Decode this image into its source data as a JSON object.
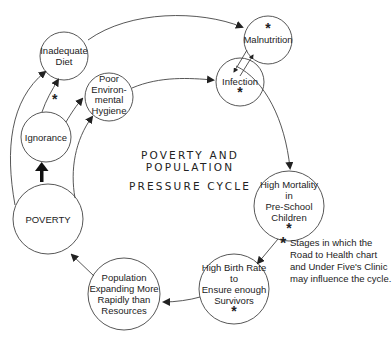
{
  "title": {
    "line1": "POVERTY AND POPULATION",
    "line2": "PRESSURE CYCLE"
  },
  "nodes": {
    "inadequate_diet": {
      "lines": [
        "Inadequate",
        "Diet"
      ],
      "star": false
    },
    "poor_hygiene": {
      "lines": [
        "Poor",
        "Environ-",
        "mental",
        "Hygiene"
      ],
      "star": false
    },
    "malnutrition": {
      "lines": [
        "Malnutrition"
      ],
      "star": true
    },
    "infection": {
      "lines": [
        "Infection"
      ],
      "star": true
    },
    "ignorance": {
      "lines": [
        "Ignorance"
      ],
      "star": false
    },
    "poverty": {
      "lines": [
        "POVERTY"
      ],
      "star": false
    },
    "high_mortality": {
      "lines": [
        "High Mortality",
        "in",
        "Pre-School",
        "Children"
      ],
      "star": true
    },
    "high_birth_rate": {
      "lines": [
        "High Birth Rate",
        "to",
        "Ensure enough",
        "Survivors"
      ],
      "star": true
    },
    "population": {
      "lines": [
        "Population",
        "Expanding More",
        "Rapidly than",
        "Resources"
      ],
      "star": false
    }
  },
  "star_symbol": "*",
  "note": {
    "symbol": "*",
    "lines": [
      "Stages in which the",
      "Road to Health chart",
      "and Under Five's Clinic",
      "may influence the cycle."
    ]
  },
  "edge_star": "*"
}
